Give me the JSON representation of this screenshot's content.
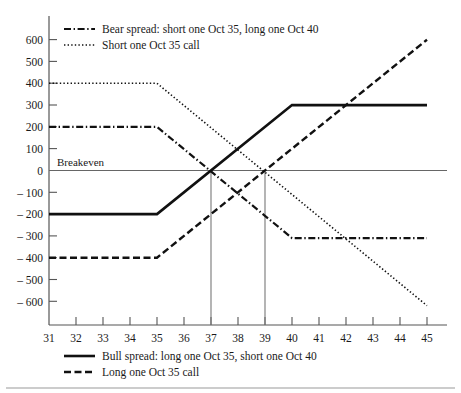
{
  "chart_data": {
    "type": "line",
    "title": "",
    "subtitle": "",
    "xlabel": "",
    "ylabel": "",
    "xlim": [
      31,
      45
    ],
    "ylim": [
      -680,
      680
    ],
    "x_ticks": [
      31,
      32,
      33,
      34,
      35,
      36,
      37,
      38,
      39,
      40,
      41,
      42,
      43,
      44,
      45
    ],
    "y_ticks": [
      600,
      500,
      400,
      300,
      200,
      100,
      0,
      -100,
      -200,
      -300,
      -400,
      -500,
      -600
    ],
    "y_tick_labels": [
      "600",
      "500",
      "400",
      "300",
      "200",
      "100",
      "0",
      "– 100",
      "– 200",
      "– 300",
      "– 400",
      "– 500",
      "– 600"
    ],
    "grid": false,
    "legend_position": "top-left and bottom",
    "annotations": [
      {
        "text": "Breakeven",
        "x": 31.3,
        "y": 55
      },
      {
        "text": "breakeven-dropline",
        "x": 37,
        "y": 0
      },
      {
        "text": "breakeven-dropline",
        "x": 39,
        "y": 0
      }
    ],
    "zero_line": 0,
    "dropline_x_values": [
      37,
      39
    ],
    "series": [
      {
        "name": "Bull spread: long one Oct 35, short one Oct 40",
        "style": "solid",
        "width": 2.6,
        "color": "#111111",
        "x": [
          31,
          35,
          40,
          45
        ],
        "values": [
          -200,
          -200,
          300,
          300
        ]
      },
      {
        "name": "Long one Oct 35 call",
        "style": "dashed",
        "width": 2.4,
        "color": "#111111",
        "x": [
          31,
          35,
          45
        ],
        "values": [
          -400,
          -400,
          600
        ]
      },
      {
        "name": "Bear spread: short one Oct 35, long one Oct 40",
        "style": "dashdot",
        "width": 2.2,
        "color": "#111111",
        "x": [
          31,
          35,
          40,
          45
        ],
        "values": [
          200,
          200,
          -310,
          -310
        ]
      },
      {
        "name": "Short one Oct 35 call",
        "style": "dotted",
        "width": 1.6,
        "color": "#111111",
        "x": [
          31,
          35,
          45
        ],
        "values": [
          400,
          400,
          -620
        ]
      }
    ]
  },
  "legend_top": {
    "items": [
      {
        "label": "Bear spread: short one Oct 35, long one Oct 40",
        "style": "dashdot"
      },
      {
        "label": "Short one Oct 35 call",
        "style": "dotted"
      }
    ]
  },
  "legend_bottom": {
    "items": [
      {
        "label": "Bull spread: long one Oct 35, short one Oct 40",
        "style": "solid"
      },
      {
        "label": "Long one Oct 35 call",
        "style": "dashed"
      }
    ]
  },
  "axis": {
    "y_labels": [
      "600",
      "500",
      "400",
      "300",
      "200",
      "100",
      "0",
      "– 100",
      "– 200",
      "– 300",
      "– 400",
      "– 500",
      "– 600"
    ],
    "x_labels": [
      "31",
      "32",
      "33",
      "34",
      "35",
      "36",
      "37",
      "38",
      "39",
      "40",
      "41",
      "42",
      "43",
      "44",
      "45"
    ]
  },
  "annotation": {
    "breakeven": "Breakeven"
  },
  "colors": {
    "ink": "#111111",
    "axis": "#555555",
    "background": "#ffffff"
  }
}
